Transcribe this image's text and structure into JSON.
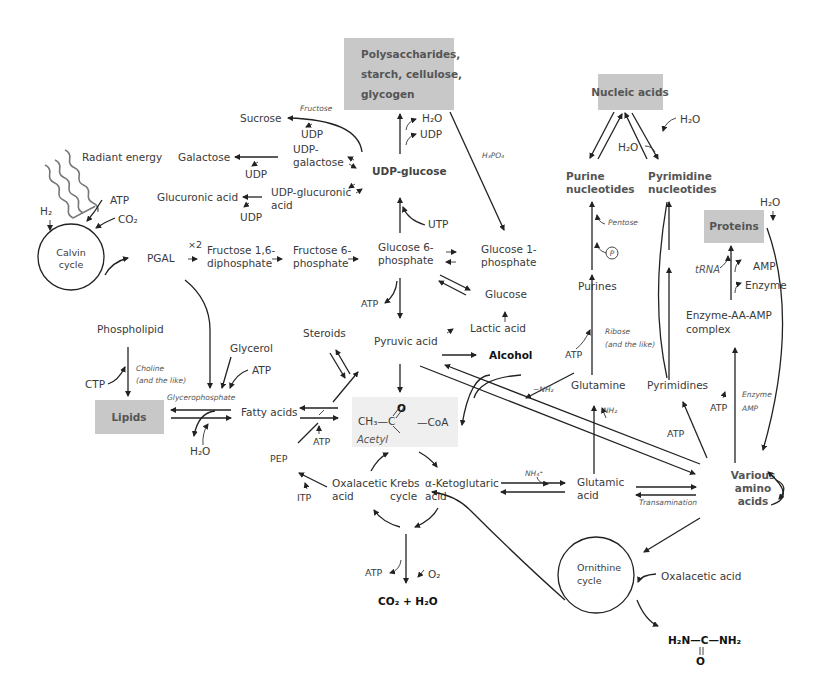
{
  "colors": {
    "box_fill": "#c8c8c8",
    "acetyl_fill": "#efefef",
    "line": "#222222",
    "text": "#3a3a3a"
  },
  "boxes": {
    "polysaccharides": [
      "Polysaccharides,",
      "starch, cellulose,",
      "glycogen"
    ],
    "nucleic_acids": "Nucleic acids",
    "proteins": "Proteins",
    "lipids": "Lipids",
    "acetyl": {
      "ch3": "CH₃—C",
      "o": "O",
      "coa": "—CoA",
      "name": "Acetyl"
    }
  },
  "carbohydrates": {
    "radiant_energy": "Radiant energy",
    "h2": "H₂",
    "atp": "ATP",
    "co2": "CO₂",
    "calvin": [
      "Calvin",
      "cycle"
    ],
    "pgal": "PGAL",
    "x2": "×2",
    "fructose16": [
      "Fructose 1,6-",
      "diphosphate"
    ],
    "fructose6": [
      "Fructose 6-",
      "phosphate"
    ],
    "glucose6": [
      "Glucose 6-",
      "phosphate"
    ],
    "glucose1": [
      "Glucose 1-",
      "phosphate"
    ],
    "glucose": "Glucose",
    "lactic": "Lactic acid",
    "pyruvic": "Pyruvic acid",
    "alcohol": "Alcohol",
    "atp_glyc": "ATP",
    "utp": "UTP",
    "udp_glucose": "UDP-glucose",
    "h2o_top": "H₂O",
    "udp_top": "UDP",
    "h3po4": "H₃PO₄",
    "sucrose": "Sucrose",
    "fructose_it": "Fructose",
    "udp_sucrose": "UDP",
    "udp_galactose": [
      "UDP-",
      "galactose"
    ],
    "galactose": "Galactose",
    "udp_gal": "UDP",
    "udp_glucuronic": [
      "UDP-glucuronic",
      "acid"
    ],
    "glucuronic": "Glucuronic acid",
    "udp_glucu": "UDP"
  },
  "lipids": {
    "phospholipid": "Phospholipid",
    "ctp": "CTP",
    "choline": [
      "Choline",
      "(and the like)"
    ],
    "glycerol": "Glycerol",
    "atp": "ATP",
    "glycerophosphate": "Glycerophosphate",
    "fatty_acids": "Fatty acids",
    "h2o": "H₂O",
    "steroids": "Steroids",
    "atp_fa": "ATP",
    "pep": "PEP",
    "itp": "ITP"
  },
  "krebs": {
    "oxalacetic": [
      "Oxalacetic",
      "acid"
    ],
    "krebs": [
      "Krebs",
      "cycle"
    ],
    "ketoglutaric": [
      "α-Ketoglutaric",
      "acid"
    ],
    "atp": "ATP",
    "o2": "O₂",
    "products": "CO₂ + H₂O"
  },
  "nitrogen": {
    "nh4": "NH₄⁺",
    "glutamic": [
      "Glutamic",
      "acid"
    ],
    "transamination": "Transamination",
    "glutamine": "Glutamine",
    "nh2_minus": "−NH₂",
    "nh2": "NH₂",
    "purines": "Purines",
    "atp_pur": "ATP",
    "ribose": [
      "Ribose",
      "(and the like)"
    ],
    "p": "P",
    "pentose": "Pentose",
    "purine_nuc": [
      "Purine",
      "nucleotides"
    ],
    "pyrimidine_nuc": [
      "Pyrimidine",
      "nucleotides"
    ],
    "h2o_a": "H₂O",
    "h2o_b": "H₂O",
    "pyrimidines": "Pyrimidines",
    "atp_pyr": "ATP",
    "various": [
      "Various",
      "amino",
      "acids"
    ],
    "atp_enz": "ATP",
    "enzyme_amp": [
      "Enzyme",
      "AMP"
    ],
    "complex": [
      "Enzyme-AA-AMP",
      "complex"
    ],
    "trna": "tRNA",
    "amp": "AMP",
    "enzyme": "Enzyme",
    "h2o_prot": "H₂O",
    "ornithine": [
      "Ornithine",
      "cycle"
    ],
    "oxalacetic": "Oxalacetic acid",
    "urea": {
      "h2n": "H₂N—C—NH₂",
      "o": "O"
    }
  }
}
